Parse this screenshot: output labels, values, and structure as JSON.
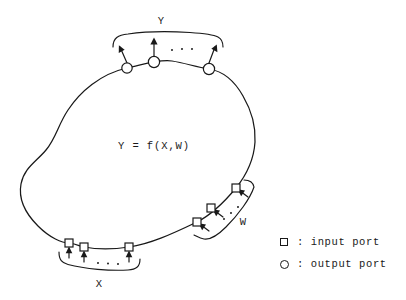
{
  "diagram": {
    "equation": "Y = f(X,W)",
    "groups": {
      "output_group": {
        "label": "Y",
        "label_x": 161,
        "label_y": 15,
        "port_type": "output",
        "port_count_shown": 3,
        "ellipsis": "..."
      },
      "input_group_x": {
        "label": "X",
        "label_x": 93,
        "label_y": 277,
        "port_type": "input",
        "port_count_shown": 3,
        "ellipsis": "..."
      },
      "input_group_w": {
        "label": "W",
        "label_x": 238,
        "label_y": 214,
        "port_type": "input",
        "port_count_shown": 3,
        "ellipsis": "..."
      }
    },
    "ports": {
      "output_circles": [
        {
          "cx": 127,
          "cy": 68,
          "r": 5.2,
          "arrow_dx": -7,
          "arrow_dy": -17
        },
        {
          "cx": 154,
          "cy": 62,
          "r": 5.6,
          "arrow_dx": 0,
          "arrow_dy": -19
        },
        {
          "cx": 209,
          "cy": 69,
          "r": 5.6,
          "arrow_dx": 6,
          "arrow_dy": -18
        }
      ],
      "input_squares_x": [
        {
          "cx": 69,
          "cy": 243,
          "size": 8,
          "arrow_dx": 1,
          "arrow_dy": -15
        },
        {
          "cx": 84,
          "cy": 247,
          "size": 8,
          "arrow_dx": 1,
          "arrow_dy": -15
        },
        {
          "cx": 129,
          "cy": 247,
          "size": 8,
          "arrow_dx": 1,
          "arrow_dy": -15
        }
      ],
      "input_squares_w": [
        {
          "cx": 236,
          "cy": 188,
          "size": 8,
          "arrow_dx": -13,
          "arrow_dy": 8
        },
        {
          "cx": 211,
          "cy": 208,
          "size": 8,
          "arrow_dx": -13,
          "arrow_dy": 8
        },
        {
          "cx": 197,
          "cy": 222,
          "size": 8,
          "arrow_dx": -13,
          "arrow_dy": 8
        }
      ]
    },
    "legend": {
      "rows": [
        {
          "marker": "square-marker-icon",
          "text": ": input port"
        },
        {
          "marker": "circle-marker-icon",
          "text": ": output port"
        }
      ]
    },
    "colors": {
      "stroke": "#191919",
      "background": "#ffffff",
      "text": "#1a1a1a"
    }
  }
}
